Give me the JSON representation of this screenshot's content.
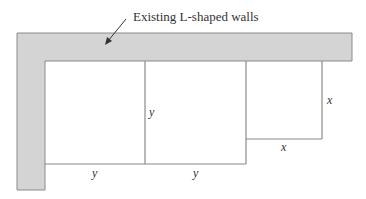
{
  "diagram": {
    "annotation": "Existing L-shaped walls",
    "labels": {
      "middle_vertical": "y",
      "bottom_left": "y",
      "bottom_middle": "y",
      "small_right": "x",
      "small_bottom": "x"
    },
    "colors": {
      "wall_fill": "#d4d4d4",
      "wall_stroke": "#8a8a8a",
      "line": "#8a8a8a",
      "text": "#333333"
    }
  }
}
